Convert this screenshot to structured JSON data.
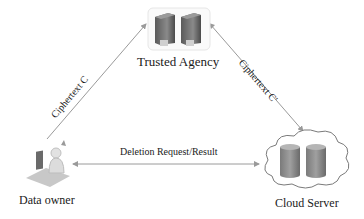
{
  "nodes": {
    "trusted_agency": {
      "label": "Trusted Agency"
    },
    "data_owner": {
      "label": "Data owner"
    },
    "cloud_server": {
      "label": "Cloud Server"
    }
  },
  "edges": {
    "owner_agency": {
      "label": "Ciphertext C"
    },
    "agency_cloud": {
      "label": "Ciphertext C'"
    },
    "owner_cloud": {
      "label": "Deletion Request/Result"
    }
  },
  "colors": {
    "arrow": "#9a9a9a",
    "server": "#6f6f6f",
    "db": "#8a8a8a",
    "text": "#1a1a1a"
  }
}
